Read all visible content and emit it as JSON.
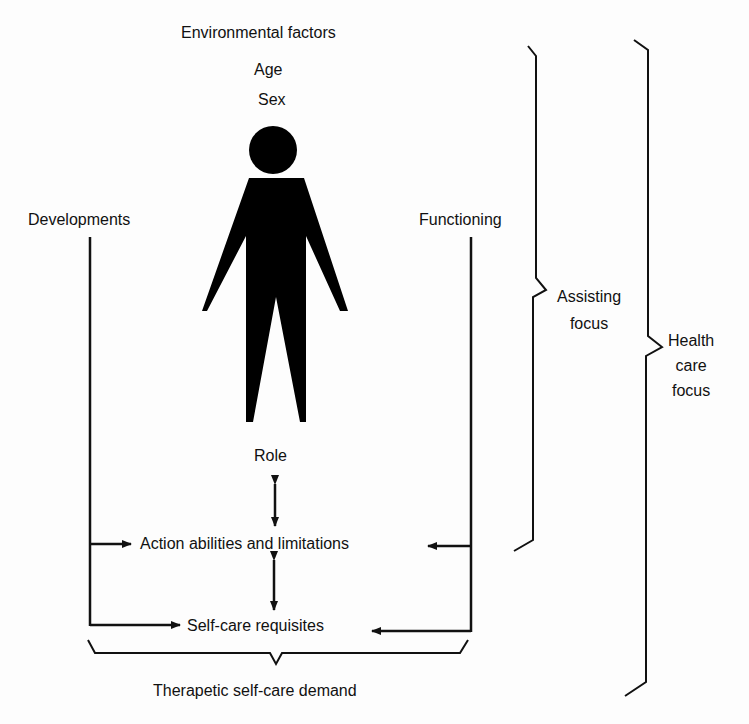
{
  "diagram": {
    "top_labels": {
      "environmental_factors": "Environmental factors",
      "age": "Age",
      "sex": "Sex"
    },
    "left_label": "Developments",
    "right_label": "Functioning",
    "center_labels": {
      "role": "Role",
      "action": "Action abilities and limitations",
      "selfcare": "Self-care requisites"
    },
    "bottom_label": "Therapetic self-care demand",
    "brackets": {
      "assisting_line1": "Assisting",
      "assisting_line2": "focus",
      "health_line1": "Health",
      "health_line2": "care",
      "health_line3": "focus"
    },
    "figure": "person-silhouette",
    "stroke_color": "#111111"
  }
}
